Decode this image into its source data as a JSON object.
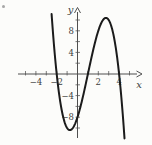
{
  "chart_data": {
    "type": "line",
    "title": "",
    "xlabel": "x",
    "ylabel": "y",
    "grid": false,
    "legend": null,
    "xlim": [
      -5.7,
      6.3
    ],
    "ylim": [
      -12.2,
      12.4
    ],
    "x_tick_step": 1,
    "y_tick_step": 2,
    "x_tick_range": [
      -5,
      5
    ],
    "y_tick_range": [
      -10,
      10
    ],
    "x_labeled_ticks": [
      -4,
      -2,
      2,
      4
    ],
    "y_labeled_ticks": [
      8,
      4,
      -4,
      -8
    ],
    "series": [
      {
        "name": "cubic-curve",
        "description": "downward cubic: y = -(x+2)(x-1)(x-4)",
        "poly_coeffs": [
          -1,
          3,
          6,
          -8
        ],
        "x_range": [
          -2.49,
          4.52
        ],
        "x_intercepts": [
          -2,
          1,
          4
        ],
        "y_intercept": -8,
        "local_min": {
          "x": -0.73,
          "y": -10.4
        },
        "local_max": {
          "x": 2.73,
          "y": 10.4
        }
      }
    ],
    "colors": {
      "curve": "#1b1b1b",
      "axis": "#4f4f4f",
      "tick": "#5a5a5a",
      "label_text": "#3c3c3c",
      "background": "#fcfcfa",
      "artifact": "#8a8a8a"
    }
  }
}
